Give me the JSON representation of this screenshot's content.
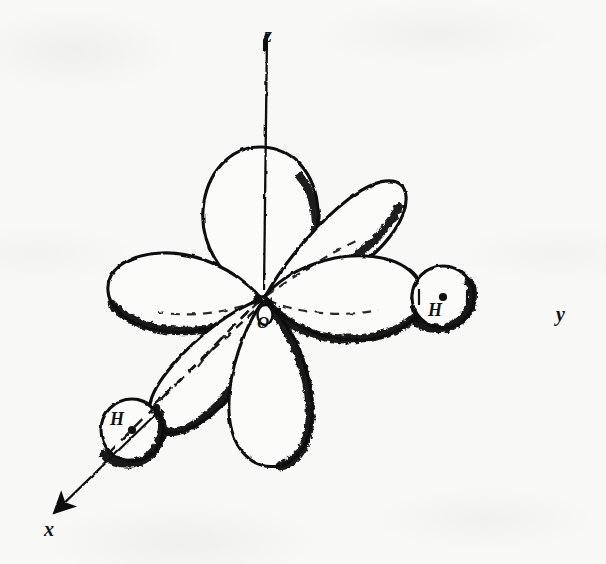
{
  "figure": {
    "kind": "scientific-diagram",
    "background_color": "#f8f8f6",
    "ink_color": "#111111"
  },
  "axes": [
    {
      "id": "z",
      "label": "z",
      "direction": "up",
      "arrow_tip": [
        268,
        30
      ],
      "origin": [
        262,
        297
      ]
    },
    {
      "id": "y",
      "label": "y",
      "direction": "right",
      "arrow_tip": [
        578,
        297
      ],
      "origin": [
        262,
        297
      ]
    },
    {
      "id": "x",
      "label": "x",
      "direction": "down-left",
      "arrow_tip": [
        50,
        517
      ],
      "origin": [
        262,
        297
      ]
    }
  ],
  "atoms": [
    {
      "id": "O",
      "label": "O",
      "element": "oxygen",
      "position": [
        262,
        297
      ],
      "nucleus_marker": "none"
    },
    {
      "id": "H-right",
      "label": "H",
      "element": "hydrogen",
      "position": [
        443,
        297
      ],
      "radius": 31,
      "nucleus_marker": "dot"
    },
    {
      "id": "H-left",
      "label": "H",
      "element": "hydrogen",
      "position": [
        132,
        430
      ],
      "radius": 31,
      "nucleus_marker": "dot"
    }
  ],
  "orbital_lobes": [
    {
      "id": "lobe-up",
      "points_toward": "+z",
      "tip": [
        262,
        148
      ]
    },
    {
      "id": "lobe-upper-right",
      "points_toward": "+y+z diagonal",
      "tip": [
        388,
        180
      ]
    },
    {
      "id": "lobe-left",
      "points_toward": "-y",
      "tip": [
        110,
        282
      ]
    },
    {
      "id": "lobe-right",
      "points_toward": "+y toward H-right",
      "tip": [
        418,
        300
      ]
    },
    {
      "id": "lobe-lower-left",
      "points_toward": "+x toward H-left",
      "tip": [
        140,
        418
      ]
    },
    {
      "id": "lobe-down",
      "points_toward": "-z",
      "tip": [
        277,
        467
      ]
    }
  ],
  "dashed_guides": [
    {
      "id": "guide-z",
      "from": [
        262,
        297
      ],
      "to": [
        262,
        145
      ]
    },
    {
      "id": "guide-y",
      "from": [
        262,
        297
      ],
      "to": [
        500,
        297
      ]
    },
    {
      "id": "guide-x",
      "from": [
        262,
        297
      ],
      "to": [
        110,
        452
      ]
    },
    {
      "id": "guide-bond-x-inner",
      "from": [
        262,
        297
      ],
      "to": [
        150,
        408
      ]
    }
  ]
}
